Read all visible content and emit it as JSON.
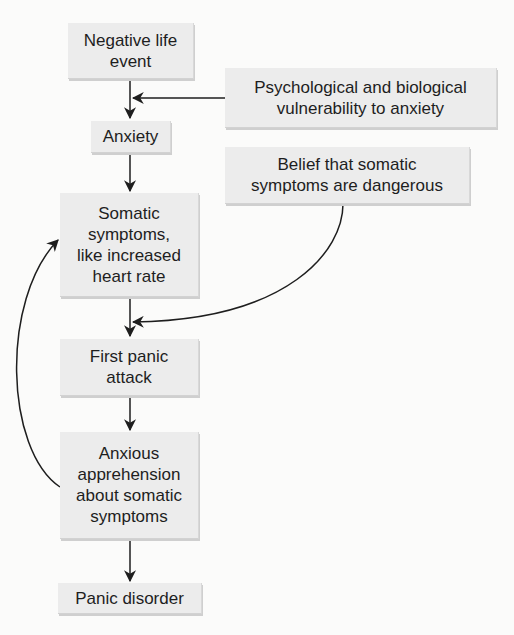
{
  "diagram": {
    "nodes": [
      {
        "id": "negative_life_event",
        "label": "Negative life\nevent"
      },
      {
        "id": "vulnerability",
        "label": "Psychological and biological\nvulnerability to anxiety"
      },
      {
        "id": "anxiety",
        "label": "Anxiety"
      },
      {
        "id": "belief",
        "label": "Belief that somatic\nsymptoms are dangerous"
      },
      {
        "id": "somatic_symptoms",
        "label": "Somatic\nsymptoms,\nlike increased\nheart rate"
      },
      {
        "id": "first_panic_attack",
        "label": "First panic\nattack"
      },
      {
        "id": "anxious_apprehension",
        "label": "Anxious\napprehension\nabout somatic\nsymptoms"
      },
      {
        "id": "panic_disorder",
        "label": "Panic disorder"
      }
    ],
    "edges": [
      {
        "from": "negative_life_event",
        "to": "anxiety"
      },
      {
        "from": "vulnerability",
        "to": "negative_life_event->anxiety"
      },
      {
        "from": "anxiety",
        "to": "somatic_symptoms"
      },
      {
        "from": "somatic_symptoms",
        "to": "first_panic_attack"
      },
      {
        "from": "belief",
        "to": "somatic_symptoms->first_panic_attack"
      },
      {
        "from": "first_panic_attack",
        "to": "anxious_apprehension"
      },
      {
        "from": "anxious_apprehension",
        "to": "somatic_symptoms"
      },
      {
        "from": "anxious_apprehension",
        "to": "panic_disorder"
      }
    ],
    "colors": {
      "box_fill": "#ececec",
      "line": "#1e1e1e",
      "background": "#fbfbfa"
    }
  }
}
